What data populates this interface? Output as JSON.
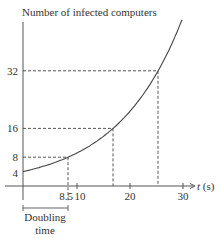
{
  "chart_data": {
    "type": "line",
    "title": "",
    "ylabel": "Number of infected computers",
    "xlabel": "t (s)",
    "xlabel_italic_var": "t",
    "xlabel_unit": "(s)",
    "function": "N(t) = 4 * 2^(t/8.5)",
    "xlim": [
      0,
      32
    ],
    "ylim": [
      0,
      48
    ],
    "grid": false,
    "legend": null,
    "x_ticks": [
      {
        "value": 8.5,
        "label": "8.5"
      },
      {
        "value": 10,
        "label": "10"
      },
      {
        "value": 20,
        "label": "20"
      },
      {
        "value": 30,
        "label": "30"
      }
    ],
    "y_ticks": [
      {
        "value": 4,
        "label": "4"
      },
      {
        "value": 8,
        "label": "8"
      },
      {
        "value": 16,
        "label": "16"
      },
      {
        "value": 32,
        "label": "32"
      }
    ],
    "series": [
      {
        "name": "Infected computers",
        "x": [
          0,
          4,
          8.5,
          12,
          17,
          21,
          25.5,
          28,
          30
        ],
        "y": [
          4,
          5.5,
          8,
          10.6,
          16,
          22.1,
          32,
          39.2,
          45.8
        ]
      }
    ],
    "reference_points": [
      {
        "t": 8.5,
        "n": 8
      },
      {
        "t": 17,
        "n": 16
      },
      {
        "t": 25.5,
        "n": 32
      }
    ],
    "annotations": [
      {
        "text": "Doubling time",
        "span": [
          0,
          8.5
        ]
      }
    ]
  },
  "labels": {
    "y_axis_title": "Number of infected computers",
    "x_axis_var": "t",
    "x_axis_unit": " (s)",
    "doubling_line1": "Doubling",
    "doubling_line2": "time",
    "y4": "4",
    "y8": "8",
    "y16": "16",
    "y32": "32",
    "x85": "8.5",
    "x10": "10",
    "x20": "20",
    "x30": "30"
  }
}
